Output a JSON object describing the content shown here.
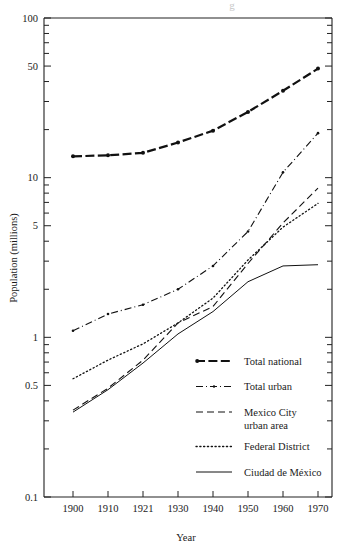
{
  "chart_data": {
    "type": "line",
    "title": "",
    "xlabel": "Year",
    "ylabel": "Population (millions)",
    "yscale": "log",
    "ylim": [
      0.1,
      100
    ],
    "ytick_labels": [
      "100",
      "50",
      "10",
      "5",
      "1",
      "0.5",
      "0.1"
    ],
    "ytick_values": [
      100,
      50,
      10,
      5,
      1,
      0.5,
      0.1
    ],
    "xtick_labels": [
      "1900",
      "1910",
      "1921",
      "1930",
      "1940",
      "1950",
      "1960",
      "1970"
    ],
    "x": [
      1900,
      1910,
      1921,
      1930,
      1940,
      1950,
      1960,
      1970
    ],
    "grid": false,
    "legend_position": "inside lower-right",
    "series": [
      {
        "name": "Total national",
        "style": "solid-with-markers",
        "values": [
          13.6,
          13.8,
          14.3,
          16.6,
          19.7,
          25.8,
          35.0,
          48.2
        ]
      },
      {
        "name": "Total urban",
        "style": "dash-dot",
        "values": [
          1.1,
          1.4,
          1.6,
          2.0,
          2.8,
          4.6,
          10.8,
          19.0
        ]
      },
      {
        "name": "Mexico City urban area",
        "style": "dashed",
        "values": [
          0.35,
          0.48,
          0.72,
          1.23,
          1.56,
          2.9,
          5.2,
          8.6
        ]
      },
      {
        "name": "Federal District",
        "style": "dotted",
        "values": [
          0.55,
          0.72,
          0.91,
          1.23,
          1.76,
          3.05,
          4.9,
          6.9
        ]
      },
      {
        "name": "Ciudad de México",
        "style": "thin-solid",
        "values": [
          0.34,
          0.47,
          0.69,
          1.05,
          1.45,
          2.23,
          2.8,
          2.85
        ]
      }
    ]
  },
  "axes": {
    "y_title": "Population (millions)",
    "x_title": "Year"
  },
  "legend": {
    "items": [
      {
        "label": "Total national",
        "style": "solid-with-markers"
      },
      {
        "label": "Total urban",
        "style": "dash-dot"
      },
      {
        "label": "Mexico City",
        "label2": "urban area",
        "style": "dashed"
      },
      {
        "label": "Federal District",
        "style": "dotted"
      },
      {
        "label": "Ciudad de México",
        "style": "thin-solid"
      }
    ]
  },
  "colors": {
    "ink": "#111111",
    "background": "#ffffff"
  }
}
